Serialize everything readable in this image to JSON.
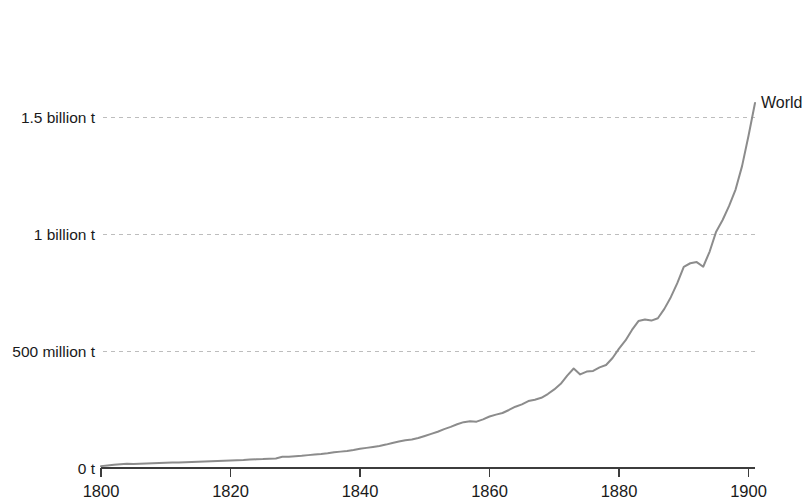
{
  "chart_data": {
    "type": "line",
    "title": "",
    "subtitle": "",
    "xlabel": "",
    "ylabel": "",
    "xlim": [
      1800,
      1901
    ],
    "ylim": [
      0,
      1950000000
    ],
    "grid": true,
    "legend_position": "line-end-right",
    "series_label": "World",
    "y_tick_labels": [
      "0 t",
      "500 million t",
      "1 billion t",
      "1.5 billion t"
    ],
    "y_tick_values": [
      0,
      500000000,
      1000000000,
      1500000000
    ],
    "x_tick_labels": [
      "1800",
      "1820",
      "1840",
      "1860",
      "1880",
      "1900"
    ],
    "x_tick_values": [
      1800,
      1820,
      1840,
      1860,
      1880,
      1900
    ],
    "series": [
      {
        "name": "World",
        "color": "#8c8c8c",
        "x": [
          1800,
          1801,
          1802,
          1803,
          1804,
          1805,
          1806,
          1807,
          1808,
          1809,
          1810,
          1811,
          1812,
          1813,
          1814,
          1815,
          1816,
          1817,
          1818,
          1819,
          1820,
          1821,
          1822,
          1823,
          1824,
          1825,
          1826,
          1827,
          1828,
          1829,
          1830,
          1831,
          1832,
          1833,
          1834,
          1835,
          1836,
          1837,
          1838,
          1839,
          1840,
          1841,
          1842,
          1843,
          1844,
          1845,
          1846,
          1847,
          1848,
          1849,
          1850,
          1851,
          1852,
          1853,
          1854,
          1855,
          1856,
          1857,
          1858,
          1859,
          1860,
          1861,
          1862,
          1863,
          1864,
          1865,
          1866,
          1867,
          1868,
          1869,
          1870,
          1871,
          1872,
          1873,
          1874,
          1875,
          1876,
          1877,
          1878,
          1879,
          1880,
          1881,
          1882,
          1883,
          1884,
          1885,
          1886,
          1887,
          1888,
          1889,
          1890,
          1891,
          1892,
          1893,
          1894,
          1895,
          1896,
          1897,
          1898,
          1899,
          1900,
          1901
        ],
        "values": [
          8000000,
          11000000,
          14000000,
          16000000,
          18000000,
          17000000,
          18000000,
          19000000,
          20000000,
          21000000,
          22000000,
          23000000,
          24000000,
          25000000,
          26000000,
          27000000,
          28000000,
          29000000,
          30000000,
          31000000,
          32000000,
          33000000,
          34000000,
          36000000,
          37000000,
          38000000,
          40000000,
          41000000,
          48000000,
          48000000,
          50000000,
          52000000,
          55000000,
          58000000,
          60000000,
          63000000,
          67000000,
          70000000,
          73000000,
          77000000,
          82000000,
          86000000,
          90000000,
          94000000,
          100000000,
          107000000,
          113000000,
          119000000,
          122000000,
          128000000,
          137000000,
          146000000,
          155000000,
          166000000,
          176000000,
          187000000,
          196000000,
          200000000,
          198000000,
          208000000,
          220000000,
          228000000,
          235000000,
          248000000,
          262000000,
          272000000,
          286000000,
          292000000,
          300000000,
          316000000,
          336000000,
          360000000,
          395000000,
          425000000,
          400000000,
          412000000,
          415000000,
          430000000,
          440000000,
          470000000,
          510000000,
          545000000,
          590000000,
          628000000,
          635000000,
          630000000,
          640000000,
          680000000,
          730000000,
          790000000,
          860000000,
          875000000,
          880000000,
          860000000,
          925000000,
          1010000000,
          1060000000,
          1120000000,
          1190000000,
          1290000000,
          1420000000,
          1560000000
        ]
      }
    ]
  },
  "axes": {
    "y_axis_labels": [
      {
        "text": "0 t",
        "value": 0
      },
      {
        "text": "500 million t",
        "value": 500000000
      },
      {
        "text": "1 billion t",
        "value": 1000000000
      },
      {
        "text": "1.5 billion t",
        "value": 1500000000
      }
    ],
    "x_axis_labels": [
      {
        "text": "1800",
        "value": 1800
      },
      {
        "text": "1820",
        "value": 1820
      },
      {
        "text": "1840",
        "value": 1840
      },
      {
        "text": "1860",
        "value": 1860
      },
      {
        "text": "1880",
        "value": 1880
      },
      {
        "text": "1900",
        "value": 1900
      }
    ]
  },
  "annotations": {
    "world_label": "World"
  },
  "colors": {
    "line": "#8c8c8c",
    "grid": "#bdbdbd",
    "axis": "#3c3c3c",
    "text": "#1a1a1a",
    "background": "#ffffff"
  }
}
